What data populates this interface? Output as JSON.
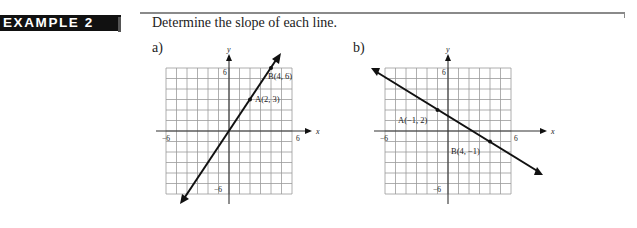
{
  "header": {
    "badge_label": "EXAMPLE 2",
    "prompt": "Determine the slope of each line."
  },
  "parts": [
    {
      "label": "a)",
      "axis_labels": {
        "x": "x",
        "y": "y"
      },
      "ticks": {
        "x_min": "−6",
        "x_max": "6",
        "y_max": "6",
        "y_min": "−6"
      },
      "points": [
        {
          "name": "A",
          "label": "A(2, 3)",
          "x": 2,
          "y": 3
        },
        {
          "name": "B",
          "label": "B(4, 6)",
          "x": 4,
          "y": 6
        }
      ]
    },
    {
      "label": "b)",
      "axis_labels": {
        "x": "x",
        "y": "y"
      },
      "ticks": {
        "x_min": "−6",
        "x_max": "6",
        "y_max": "6",
        "y_min": "−6"
      },
      "points": [
        {
          "name": "A",
          "label": "A(−1, 2)",
          "x": -1,
          "y": 2
        },
        {
          "name": "B",
          "label": "B(4, −1)",
          "x": 4,
          "y": -1
        }
      ]
    }
  ],
  "chart_data": [
    {
      "type": "line",
      "title": "a)",
      "xlabel": "x",
      "ylabel": "y",
      "xlim": [
        -6,
        6
      ],
      "ylim": [
        -6,
        6
      ],
      "grid": true,
      "x_ticks_labeled": [
        -6,
        6
      ],
      "y_ticks_labeled": [
        6,
        -6
      ],
      "line": {
        "through": [
          [
            2,
            3
          ],
          [
            4,
            6
          ]
        ],
        "slope": 1.5,
        "y_intercept": 0,
        "arrows_both_ends": true
      },
      "points": [
        {
          "label": "A(2, 3)",
          "x": 2,
          "y": 3
        },
        {
          "label": "B(4, 6)",
          "x": 4,
          "y": 6
        }
      ]
    },
    {
      "type": "line",
      "title": "b)",
      "xlabel": "x",
      "ylabel": "y",
      "xlim": [
        -6,
        6
      ],
      "ylim": [
        -6,
        6
      ],
      "grid": true,
      "x_ticks_labeled": [
        -6,
        6
      ],
      "y_ticks_labeled": [
        6,
        -6
      ],
      "line": {
        "through": [
          [
            -1,
            2
          ],
          [
            4,
            -1
          ]
        ],
        "slope": -0.6,
        "y_intercept": 1.4,
        "arrows_both_ends": true
      },
      "points": [
        {
          "label": "A(−1, 2)",
          "x": -1,
          "y": 2
        },
        {
          "label": "B(4, −1)",
          "x": 4,
          "y": -1
        }
      ]
    }
  ]
}
